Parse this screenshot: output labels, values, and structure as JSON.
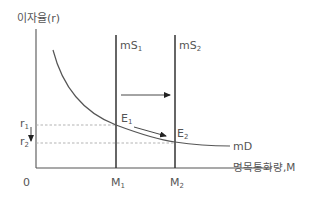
{
  "diagram": {
    "type": "money-market-supply-demand",
    "y_axis_label": "이자율(r)",
    "x_axis_label": "명목통화량,M",
    "origin_label": "0",
    "curves": {
      "supply_1": {
        "label": "mS",
        "sub": "1"
      },
      "supply_2": {
        "label": "mS",
        "sub": "2"
      },
      "demand": {
        "label": "mD"
      }
    },
    "points": {
      "e1": {
        "label": "E",
        "sub": "1"
      },
      "e2": {
        "label": "E",
        "sub": "2"
      }
    },
    "y_ticks": {
      "r1": {
        "label": "r",
        "sub": "1"
      },
      "r2": {
        "label": "r",
        "sub": "2"
      }
    },
    "x_ticks": {
      "m1": {
        "label": "M",
        "sub": "1"
      },
      "m2": {
        "label": "M",
        "sub": "2"
      }
    },
    "arrows": [
      {
        "name": "supply-shift-arrow",
        "direction": "right",
        "meaning": "mS1 → mS2"
      },
      {
        "name": "equilibrium-move-arrow",
        "direction": "down-right",
        "meaning": "E1 → E2"
      },
      {
        "name": "rate-fall-arrow",
        "direction": "down",
        "meaning": "r1 → r2"
      }
    ],
    "colors": {
      "line": "#444444",
      "curve": "#555555",
      "dashed": "#aaaaaa",
      "text": "#555555"
    }
  }
}
